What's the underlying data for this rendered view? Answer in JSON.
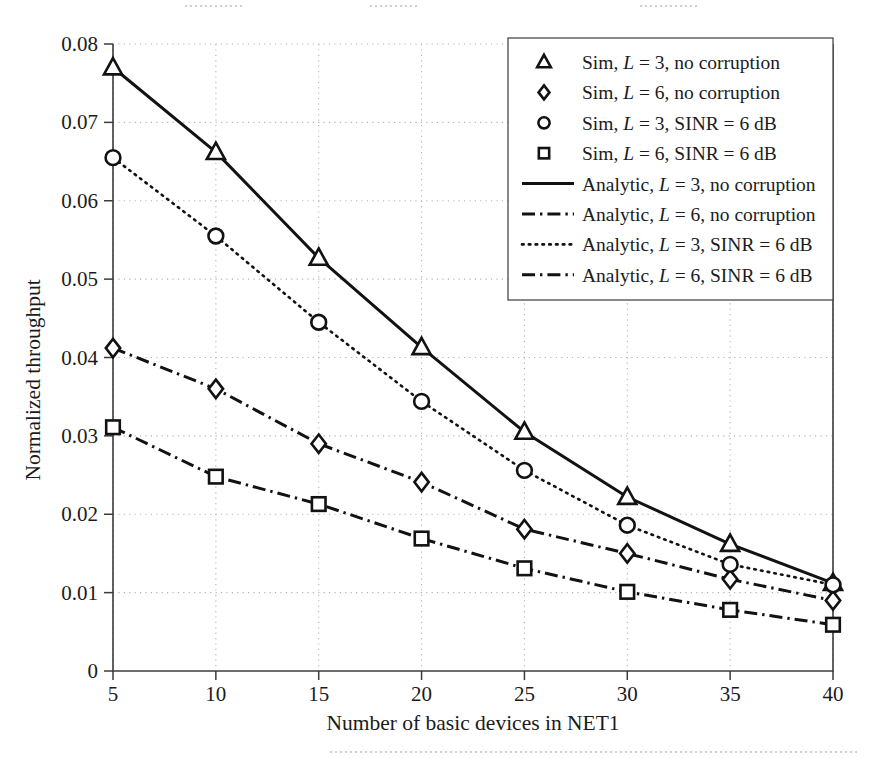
{
  "figure": {
    "background_color": "#ffffff",
    "line_color": "#121212",
    "grid_color": "#b9b2ad"
  },
  "axes": {
    "x_title": "Number of basic devices in NET1",
    "y_title": "Normalized throughput",
    "x_ticks": [
      "5",
      "10",
      "15",
      "20",
      "25",
      "30",
      "35",
      "40"
    ],
    "y_ticks": [
      "0",
      "0.01",
      "0.02",
      "0.03",
      "0.04",
      "0.05",
      "0.06",
      "0.07",
      "0.08"
    ]
  },
  "legend": {
    "entries": [
      {
        "marker": "triangle-marker",
        "style": "marker",
        "label": "Sim, L = 3, no corruption",
        "pre": "Sim, ",
        "ital": "L",
        "post": " = 3, no corruption"
      },
      {
        "marker": "diamond-marker",
        "style": "marker",
        "label": "Sim, L = 6, no corruption",
        "pre": "Sim, ",
        "ital": "L",
        "post": " = 6, no corruption"
      },
      {
        "marker": "circle-marker",
        "style": "marker",
        "label": "Sim, L = 3, SINR = 6 dB",
        "pre": "Sim, ",
        "ital": "L",
        "post": " = 3, SINR = 6 dB"
      },
      {
        "marker": "square-marker",
        "style": "marker",
        "label": "Sim, L = 6, SINR = 6 dB",
        "pre": "Sim, ",
        "ital": "L",
        "post": " = 6, SINR = 6 dB"
      },
      {
        "marker": "solid-line-swatch",
        "style": "solid",
        "label": "Analytic, L = 3, no corruption",
        "pre": "Analytic, ",
        "ital": "L",
        "post": " = 3, no corruption"
      },
      {
        "marker": "dashdot-line-swatch",
        "style": "dashdot",
        "label": "Analytic, L = 6, no corruption",
        "pre": "Analytic, ",
        "ital": "L",
        "post": " = 6, no corruption"
      },
      {
        "marker": "dotted-line-swatch",
        "style": "dotted",
        "label": "Analytic, L = 3, SINR = 6 dB",
        "pre": "Analytic, ",
        "ital": "L",
        "post": " = 3, SINR = 6 dB"
      },
      {
        "marker": "dashdot-line-swatch-2",
        "style": "dashdot",
        "label": "Analytic, L = 6, SINR = 6 dB",
        "pre": "Analytic, ",
        "ital": "L",
        "post": " = 6, SINR = 6 dB"
      }
    ]
  },
  "chart_data": {
    "type": "line",
    "title": "",
    "xlabel": "Number of basic devices in NET1",
    "ylabel": "Normalized throughput",
    "xlim": [
      5,
      40
    ],
    "ylim": [
      0,
      0.08
    ],
    "xticks": [
      5,
      10,
      15,
      20,
      25,
      30,
      35,
      40
    ],
    "yticks": [
      0,
      0.01,
      0.02,
      0.03,
      0.04,
      0.05,
      0.06,
      0.07,
      0.08
    ],
    "grid": true,
    "legend_position": "upper right",
    "x": [
      5,
      10,
      15,
      20,
      25,
      30,
      35,
      40
    ],
    "series": [
      {
        "name": "Sim, L = 3, no corruption",
        "marker": "triangle",
        "linestyle": "none",
        "values": [
          0.077,
          0.0662,
          0.0527,
          0.0413,
          0.0305,
          0.0222,
          0.0162,
          0.0112
        ]
      },
      {
        "name": "Sim, L = 6, no corruption",
        "marker": "diamond",
        "linestyle": "none",
        "values": [
          0.0412,
          0.036,
          0.029,
          0.0241,
          0.0181,
          0.015,
          0.0117,
          0.009
        ]
      },
      {
        "name": "Sim, L = 3, SINR = 6 dB",
        "marker": "circle",
        "linestyle": "none",
        "values": [
          0.0655,
          0.0555,
          0.0445,
          0.0344,
          0.0256,
          0.0186,
          0.0136,
          0.011
        ]
      },
      {
        "name": "Sim, L = 6, SINR = 6 dB",
        "marker": "square",
        "linestyle": "none",
        "values": [
          0.0311,
          0.0248,
          0.0213,
          0.0169,
          0.0131,
          0.0101,
          0.0078,
          0.0059
        ]
      },
      {
        "name": "Analytic, L = 3, no corruption",
        "marker": "none",
        "linestyle": "solid",
        "values": [
          0.077,
          0.0662,
          0.0527,
          0.0413,
          0.0305,
          0.0222,
          0.0162,
          0.0112
        ]
      },
      {
        "name": "Analytic, L = 6, no corruption",
        "marker": "none",
        "linestyle": "dashdot",
        "values": [
          0.0412,
          0.036,
          0.029,
          0.0241,
          0.0181,
          0.015,
          0.0117,
          0.009
        ]
      },
      {
        "name": "Analytic, L = 3, SINR = 6 dB",
        "marker": "none",
        "linestyle": "dotted",
        "values": [
          0.0655,
          0.0555,
          0.0445,
          0.0344,
          0.0256,
          0.0186,
          0.0136,
          0.011
        ]
      },
      {
        "name": "Analytic, L = 6, SINR = 6 dB",
        "marker": "none",
        "linestyle": "dashdot",
        "values": [
          0.0311,
          0.0248,
          0.0213,
          0.0169,
          0.0131,
          0.0101,
          0.0078,
          0.0059
        ]
      }
    ]
  }
}
